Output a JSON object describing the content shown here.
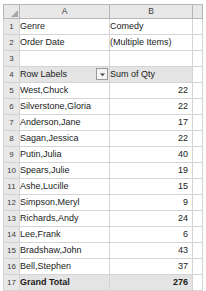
{
  "app": {
    "type": "spreadsheet-pivot-table",
    "select_all_icon": "select-all-triangle-icon"
  },
  "columns": {
    "headers": [
      "A",
      "B"
    ],
    "corner": ""
  },
  "rows": {
    "numbers": [
      "1",
      "2",
      "3",
      "4",
      "5",
      "6",
      "7",
      "8",
      "9",
      "10",
      "11",
      "12",
      "13",
      "14",
      "15",
      "16",
      "17"
    ]
  },
  "filters": [
    {
      "row": "1",
      "field_label": "Genre",
      "value": "Comedy",
      "button_icon": "filter-funnel-icon",
      "button_name": "genre-filter-button"
    },
    {
      "row": "2",
      "field_label": "Order Date",
      "value": "(Multiple Items)",
      "button_icon": "filter-funnel-icon",
      "button_name": "order-date-filter-button"
    }
  ],
  "pivot": {
    "row_labels_header": "Row Labels",
    "row_labels_dropdown_icon": "chevron-down-icon",
    "value_header": "Sum of Qty",
    "rows": [
      {
        "label": "West,Chuck",
        "value": "22"
      },
      {
        "label": "Silverstone,Gloria",
        "value": "22"
      },
      {
        "label": "Anderson,Jane",
        "value": "17"
      },
      {
        "label": "Sagan,Jessica",
        "value": "22"
      },
      {
        "label": "Putin,Julia",
        "value": "40"
      },
      {
        "label": "Spears,Julie",
        "value": "19"
      },
      {
        "label": "Ashe,Lucille",
        "value": "15"
      },
      {
        "label": "Simpson,Meryl",
        "value": "9"
      },
      {
        "label": "Richards,Andy",
        "value": "24"
      },
      {
        "label": "Lee,Frank",
        "value": "6"
      },
      {
        "label": "Bradshaw,John",
        "value": "43"
      },
      {
        "label": "Bell,Stephen",
        "value": "37"
      }
    ],
    "grand_total_label": "Grand Total",
    "grand_total_value": "276"
  },
  "colors": {
    "header_fill": "#e8e8e8",
    "pivot_header_fill": "#e4e4e4",
    "total_fill": "#e4e4e4",
    "gridline": "#d4d4d4",
    "border": "#b6b6b6",
    "text": "#1a1a1a"
  }
}
